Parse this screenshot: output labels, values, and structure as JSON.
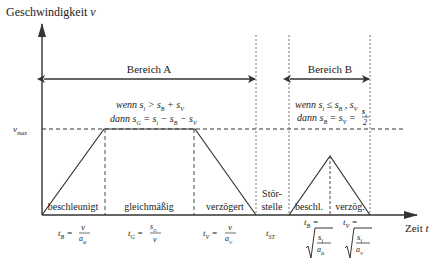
{
  "axes": {
    "y_label": "Geschwindigkeit v",
    "x_label": "Zeit t",
    "vmax_label": "v_max"
  },
  "regions": {
    "a": {
      "label": "Bereich A",
      "condition_line1": "wenn s_i > s_B + s_V,",
      "condition_line2": "dann s_G = s_i − s_B − s_V"
    },
    "b": {
      "label": "Bereich B",
      "condition_line1": "wenn s_i ≤ s_B , s_V",
      "condition_line2": "dann s_B = s_V = s_i / 2"
    }
  },
  "phases": [
    {
      "label": "beschleunigt",
      "formula": "t_B = v / a_B"
    },
    {
      "label": "gleichmäßig",
      "formula": "t_G = s_G / v"
    },
    {
      "label": "verzögert",
      "formula": "t_V = v / a_V"
    },
    {
      "label": "Stör-\nstelle",
      "formula": "t_ST"
    },
    {
      "label": "beschl.",
      "formula": "t_B = √(s_i / a_B)"
    },
    {
      "label": "verzög.",
      "formula": "t_V = √(s_i / a_V)"
    }
  ],
  "labels": {
    "stoer1": "Stör-",
    "stoer2": "stelle",
    "tB": "t",
    "tB_sub": "B",
    "tG": "t",
    "tG_sub": "G",
    "tV": "t",
    "tV_sub": "V",
    "tST": "t",
    "tST_sub": "ST",
    "v": "v",
    "aB": "a",
    "aB_sub": "B",
    "aV": "a",
    "aV_sub": "V",
    "sG": "s",
    "sG_sub": "G",
    "si": "s",
    "si_sub": "i",
    "eq": "=",
    "y_text": "Geschwindigkeit ",
    "y_var": "v",
    "x_text": "Zeit ",
    "x_var": "t",
    "vmax_v": "v",
    "vmax_sub": "max",
    "a_wenn": "wenn s",
    "a_wenn_rest": " > s",
    "a_wenn_rest2": " + s",
    "a_dann": "dann s",
    "a_dann_rest": " = s",
    "a_dann_rest2": " − s",
    "a_dann_rest3": " − s",
    "b_wenn": "wenn s",
    "b_wenn_rest": " ≤ s",
    "b_wenn_rest2": " , s",
    "b_dann": "dann s",
    "b_dann_rest": " = s",
    "b_dann_rest2": " = ",
    "two": "2",
    "beschleunigt": "beschleunigt",
    "gleichmaessig": "gleichmäßig",
    "verzoegert": "verzögert",
    "beschl": "beschl.",
    "verzoeg": "verzög."
  },
  "colors": {
    "line": "#333333",
    "text": "#222222",
    "background": "#ffffff"
  }
}
